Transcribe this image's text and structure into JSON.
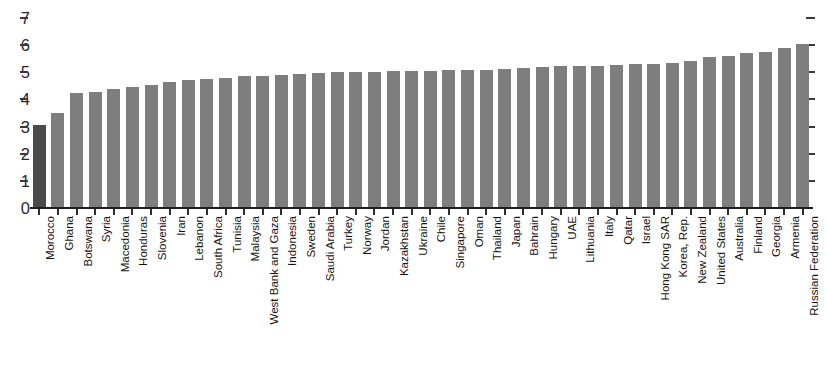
{
  "chart_data": {
    "type": "bar",
    "title": "",
    "xlabel": "",
    "ylabel": "",
    "ylim": [
      0,
      7
    ],
    "yticks": [
      0,
      1,
      2,
      3,
      4,
      5,
      6,
      7
    ],
    "grid": false,
    "legend": null,
    "orientation": "vertical",
    "sorted": "ascending",
    "highlight_category": "Morocco",
    "bar_color": "#7e7e7e",
    "highlight_color": "#4a4a4a",
    "axis_color": "#1d1d1d",
    "categories": [
      "Morocco",
      "Ghana",
      "Botswana",
      "Syria",
      "Macedonia",
      "Honduras",
      "Slovenia",
      "Iran",
      "Lebanon",
      "South Africa",
      "Tunisia",
      "Malaysia",
      "West Bank and Gaza",
      "Indonesia",
      "Sweden",
      "Saudi Arabia",
      "Turkey",
      "Norway",
      "Jordan",
      "Kazakhstan",
      "Ukraine",
      "Chile",
      "Singapore",
      "Oman",
      "Thailand",
      "Japan",
      "Bahrain",
      "Hungary",
      "UAE",
      "Lithuania",
      "Italy",
      "Qatar",
      "Israel",
      "Hong Kong SAR",
      "Korea, Rep.",
      "New Zealand",
      "United States",
      "Australia",
      "Finland",
      "Georgia",
      "Armenia",
      "Russian Federation"
    ],
    "values": [
      3.05,
      3.5,
      4.25,
      4.27,
      4.37,
      4.45,
      4.55,
      4.65,
      4.7,
      4.75,
      4.8,
      4.85,
      4.87,
      4.9,
      4.95,
      4.97,
      5.0,
      5.0,
      5.02,
      5.05,
      5.05,
      5.05,
      5.07,
      5.07,
      5.1,
      5.12,
      5.15,
      5.2,
      5.22,
      5.25,
      5.25,
      5.27,
      5.3,
      5.3,
      5.35,
      5.4,
      5.55,
      5.6,
      5.7,
      5.75,
      5.9,
      6.05
    ]
  },
  "yaxis": {
    "ticks": [
      "0",
      "1",
      "2",
      "3",
      "4",
      "5",
      "6",
      "7"
    ]
  }
}
